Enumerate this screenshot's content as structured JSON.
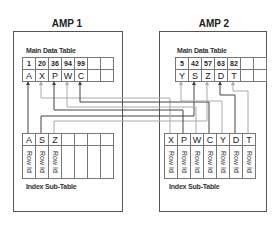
{
  "amp1": {
    "title": "AMP 1",
    "main_table": {
      "label": "Main Data Table",
      "row_ids": [
        "1",
        "20",
        "36",
        "94",
        "99",
        "",
        ""
      ],
      "values": [
        "A",
        "X",
        "P",
        "W",
        "C",
        "",
        ""
      ]
    },
    "index_table": {
      "label": "Index Sub-Table",
      "keys": [
        "A",
        "S",
        "Z",
        "",
        "",
        "",
        ""
      ],
      "row_refs": [
        "Row Id",
        "Row Id",
        "Row Id",
        "",
        "",
        "",
        ""
      ]
    }
  },
  "amp2": {
    "title": "AMP 2",
    "main_table": {
      "label": "Main Data Table",
      "row_ids": [
        "5",
        "42",
        "57",
        "63",
        "82",
        "",
        ""
      ],
      "values": [
        "Y",
        "S",
        "Z",
        "D",
        "T",
        "",
        ""
      ]
    },
    "index_table": {
      "label": "Index Sub-Table",
      "keys": [
        "X",
        "P",
        "W",
        "C",
        "Y",
        "D",
        "T"
      ],
      "row_refs": [
        "Row Id",
        "Row Id",
        "Row Id",
        "Row Id",
        "Row Id",
        "Row Id",
        "Row Id"
      ]
    }
  },
  "colors": {
    "dark_line": "#444444",
    "light_line": "#aaaaaa",
    "border": "#555555"
  }
}
